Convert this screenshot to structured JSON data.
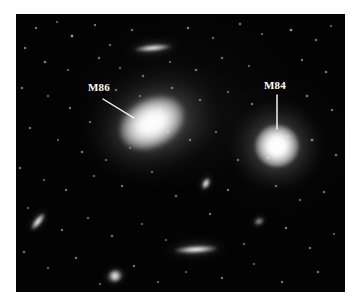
{
  "figure": {
    "kind": "astronomical-photograph",
    "background_color": "#000000",
    "page_color": "#ffffff",
    "plate": {
      "x": 16,
      "y": 14,
      "width": 329,
      "height": 278
    }
  },
  "annotations": [
    {
      "id": "m86",
      "label": "M86",
      "label_x": 88,
      "label_y": 82,
      "color": "#ffffff",
      "leader": {
        "x1": 103,
        "y1": 99,
        "x2": 134,
        "y2": 118
      }
    },
    {
      "id": "m84",
      "label": "M84",
      "label_x": 264,
      "label_y": 80,
      "color": "#ffffff",
      "leader": {
        "x1": 277,
        "y1": 95,
        "x2": 277,
        "y2": 129
      }
    }
  ],
  "galaxies": [
    {
      "id": "m86",
      "name": "M86",
      "type": "elliptical",
      "cx": 152,
      "cy": 123,
      "rx": 34,
      "ry": 24,
      "angle": -28,
      "halo_rx": 62,
      "halo_ry": 46
    },
    {
      "id": "m84",
      "name": "M84",
      "type": "elliptical",
      "cx": 277,
      "cy": 146,
      "rx": 22,
      "ry": 21,
      "angle": 0,
      "halo_rx": 44,
      "halo_ry": 42
    },
    {
      "id": "ngc4402",
      "name": "",
      "type": "edge-on",
      "cx": 153,
      "cy": 48,
      "rx": 18,
      "ry": 3,
      "angle": -5,
      "halo_rx": 26,
      "halo_ry": 8
    },
    {
      "id": "bottom-edge-on",
      "name": "",
      "type": "edge-on",
      "cx": 196,
      "cy": 249,
      "rx": 21,
      "ry": 3.5,
      "angle": -3,
      "halo_rx": 30,
      "halo_ry": 9
    },
    {
      "id": "left-spindle",
      "name": "",
      "type": "spindle",
      "cx": 38,
      "cy": 221,
      "rx": 10,
      "ry": 3.5,
      "angle": -52,
      "halo_rx": 14,
      "halo_ry": 7
    },
    {
      "id": "center-small",
      "name": "",
      "type": "spindle",
      "cx": 206,
      "cy": 183,
      "rx": 6,
      "ry": 3.5,
      "angle": -62,
      "halo_rx": 10,
      "halo_ry": 7
    },
    {
      "id": "lower-left-blob",
      "name": "",
      "type": "blob",
      "cx": 115,
      "cy": 276,
      "rx": 8,
      "ry": 6,
      "angle": -20,
      "halo_rx": 12,
      "halo_ry": 10
    },
    {
      "id": "right-faint",
      "name": "",
      "type": "faint",
      "cx": 259,
      "cy": 221,
      "rx": 5,
      "ry": 3.5,
      "angle": -25,
      "halo_rx": 8,
      "halo_ry": 6
    }
  ],
  "stars": [
    {
      "x": 36,
      "y": 28,
      "r": 0.9,
      "b": 0.55
    },
    {
      "x": 57,
      "y": 22,
      "r": 0.7,
      "b": 0.4
    },
    {
      "x": 72,
      "y": 36,
      "r": 1.2,
      "b": 0.8
    },
    {
      "x": 95,
      "y": 25,
      "r": 0.8,
      "b": 0.5
    },
    {
      "x": 110,
      "y": 45,
      "r": 0.7,
      "b": 0.45
    },
    {
      "x": 132,
      "y": 30,
      "r": 0.8,
      "b": 0.5
    },
    {
      "x": 188,
      "y": 28,
      "r": 0.9,
      "b": 0.6
    },
    {
      "x": 213,
      "y": 38,
      "r": 0.7,
      "b": 0.45
    },
    {
      "x": 240,
      "y": 24,
      "r": 0.8,
      "b": 0.5
    },
    {
      "x": 262,
      "y": 34,
      "r": 0.7,
      "b": 0.42
    },
    {
      "x": 291,
      "y": 30,
      "r": 1.1,
      "b": 0.75
    },
    {
      "x": 316,
      "y": 40,
      "r": 0.9,
      "b": 0.55
    },
    {
      "x": 331,
      "y": 26,
      "r": 0.7,
      "b": 0.4
    },
    {
      "x": 25,
      "y": 48,
      "r": 0.8,
      "b": 0.5
    },
    {
      "x": 45,
      "y": 62,
      "r": 1.0,
      "b": 0.65
    },
    {
      "x": 68,
      "y": 70,
      "r": 0.7,
      "b": 0.4
    },
    {
      "x": 99,
      "y": 58,
      "r": 0.8,
      "b": 0.5
    },
    {
      "x": 120,
      "y": 68,
      "r": 0.7,
      "b": 0.42
    },
    {
      "x": 143,
      "y": 76,
      "r": 0.8,
      "b": 0.5
    },
    {
      "x": 170,
      "y": 62,
      "r": 0.7,
      "b": 0.4
    },
    {
      "x": 196,
      "y": 70,
      "r": 0.9,
      "b": 0.55
    },
    {
      "x": 222,
      "y": 58,
      "r": 0.8,
      "b": 0.48
    },
    {
      "x": 249,
      "y": 66,
      "r": 0.7,
      "b": 0.4
    },
    {
      "x": 302,
      "y": 60,
      "r": 0.8,
      "b": 0.5
    },
    {
      "x": 326,
      "y": 72,
      "r": 0.9,
      "b": 0.58
    },
    {
      "x": 22,
      "y": 88,
      "r": 0.9,
      "b": 0.55
    },
    {
      "x": 48,
      "y": 96,
      "r": 0.7,
      "b": 0.4
    },
    {
      "x": 70,
      "y": 108,
      "r": 0.8,
      "b": 0.5
    },
    {
      "x": 90,
      "y": 122,
      "r": 0.7,
      "b": 0.45
    },
    {
      "x": 116,
      "y": 90,
      "r": 0.8,
      "b": 0.5
    },
    {
      "x": 140,
      "y": 96,
      "r": 0.7,
      "b": 0.4
    },
    {
      "x": 172,
      "y": 88,
      "r": 0.9,
      "b": 0.55
    },
    {
      "x": 200,
      "y": 100,
      "r": 0.8,
      "b": 0.5
    },
    {
      "x": 228,
      "y": 92,
      "r": 0.7,
      "b": 0.42
    },
    {
      "x": 252,
      "y": 104,
      "r": 0.8,
      "b": 0.5
    },
    {
      "x": 307,
      "y": 96,
      "r": 0.9,
      "b": 0.6
    },
    {
      "x": 332,
      "y": 110,
      "r": 0.8,
      "b": 0.5
    },
    {
      "x": 30,
      "y": 128,
      "r": 0.8,
      "b": 0.5
    },
    {
      "x": 58,
      "y": 140,
      "r": 0.7,
      "b": 0.4
    },
    {
      "x": 82,
      "y": 152,
      "r": 0.9,
      "b": 0.55
    },
    {
      "x": 106,
      "y": 160,
      "r": 0.7,
      "b": 0.42
    },
    {
      "x": 130,
      "y": 148,
      "r": 0.6,
      "b": 0.35
    },
    {
      "x": 190,
      "y": 140,
      "r": 0.8,
      "b": 0.5
    },
    {
      "x": 216,
      "y": 132,
      "r": 0.7,
      "b": 0.4
    },
    {
      "x": 238,
      "y": 160,
      "r": 0.8,
      "b": 0.48
    },
    {
      "x": 312,
      "y": 140,
      "r": 1.0,
      "b": 0.68
    },
    {
      "x": 336,
      "y": 155,
      "r": 0.8,
      "b": 0.5
    },
    {
      "x": 20,
      "y": 168,
      "r": 0.8,
      "b": 0.5
    },
    {
      "x": 44,
      "y": 180,
      "r": 0.7,
      "b": 0.4
    },
    {
      "x": 66,
      "y": 190,
      "r": 0.8,
      "b": 0.5
    },
    {
      "x": 94,
      "y": 176,
      "r": 0.7,
      "b": 0.42
    },
    {
      "x": 122,
      "y": 186,
      "r": 0.8,
      "b": 0.5
    },
    {
      "x": 152,
      "y": 172,
      "r": 0.7,
      "b": 0.4
    },
    {
      "x": 176,
      "y": 196,
      "r": 0.8,
      "b": 0.48
    },
    {
      "x": 228,
      "y": 190,
      "r": 0.9,
      "b": 0.55
    },
    {
      "x": 276,
      "y": 186,
      "r": 0.8,
      "b": 0.5
    },
    {
      "x": 300,
      "y": 200,
      "r": 0.7,
      "b": 0.42
    },
    {
      "x": 324,
      "y": 192,
      "r": 0.8,
      "b": 0.5
    },
    {
      "x": 28,
      "y": 208,
      "r": 0.7,
      "b": 0.4
    },
    {
      "x": 62,
      "y": 230,
      "r": 0.8,
      "b": 0.5
    },
    {
      "x": 88,
      "y": 218,
      "r": 0.7,
      "b": 0.42
    },
    {
      "x": 112,
      "y": 236,
      "r": 0.8,
      "b": 0.5
    },
    {
      "x": 142,
      "y": 224,
      "r": 0.7,
      "b": 0.4
    },
    {
      "x": 166,
      "y": 240,
      "r": 0.6,
      "b": 0.35
    },
    {
      "x": 210,
      "y": 214,
      "r": 0.8,
      "b": 0.5
    },
    {
      "x": 244,
      "y": 244,
      "r": 0.7,
      "b": 0.42
    },
    {
      "x": 286,
      "y": 228,
      "r": 0.9,
      "b": 0.58
    },
    {
      "x": 310,
      "y": 248,
      "r": 0.8,
      "b": 0.5
    },
    {
      "x": 334,
      "y": 234,
      "r": 0.7,
      "b": 0.4
    },
    {
      "x": 24,
      "y": 252,
      "r": 0.8,
      "b": 0.5
    },
    {
      "x": 48,
      "y": 268,
      "r": 0.7,
      "b": 0.42
    },
    {
      "x": 76,
      "y": 258,
      "r": 0.9,
      "b": 0.55
    },
    {
      "x": 100,
      "y": 284,
      "r": 0.7,
      "b": 0.4
    },
    {
      "x": 134,
      "y": 266,
      "r": 0.8,
      "b": 0.5
    },
    {
      "x": 158,
      "y": 282,
      "r": 0.7,
      "b": 0.42
    },
    {
      "x": 186,
      "y": 272,
      "r": 0.6,
      "b": 0.35
    },
    {
      "x": 222,
      "y": 278,
      "r": 0.8,
      "b": 0.5
    },
    {
      "x": 254,
      "y": 264,
      "r": 0.7,
      "b": 0.4
    },
    {
      "x": 282,
      "y": 282,
      "r": 0.8,
      "b": 0.5
    },
    {
      "x": 318,
      "y": 272,
      "r": 0.9,
      "b": 0.55
    },
    {
      "x": 160,
      "y": 110,
      "r": 0.7,
      "b": 0.6
    },
    {
      "x": 168,
      "y": 132,
      "r": 0.6,
      "b": 0.5
    },
    {
      "x": 268,
      "y": 158,
      "r": 0.6,
      "b": 0.5
    },
    {
      "x": 288,
      "y": 136,
      "r": 0.6,
      "b": 0.5
    }
  ]
}
